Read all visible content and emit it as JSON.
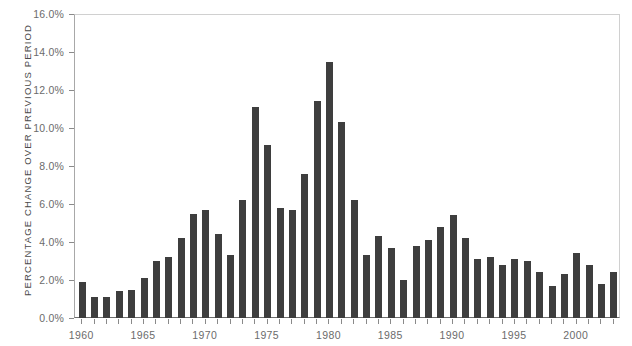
{
  "chart_data": {
    "type": "bar",
    "title": "",
    "subtitle": "",
    "xlabel": "",
    "ylabel": "PERCENTAGE CHANGE OVER PREVIOUS PERIOD",
    "ylim": [
      0,
      16
    ],
    "ytick_labels": [
      "0.0%",
      "2.0%",
      "4.0%",
      "6.0%",
      "8.0%",
      "10.0%",
      "12.0%",
      "14.0%",
      "16.0%"
    ],
    "ytick_values": [
      0,
      2,
      4,
      6,
      8,
      10,
      12,
      14,
      16
    ],
    "xtick_labels": [
      "1960",
      "1965",
      "1970",
      "1975",
      "1980",
      "1985",
      "1990",
      "1995",
      "2000"
    ],
    "xtick_values": [
      1960,
      1965,
      1970,
      1975,
      1980,
      1985,
      1990,
      1995,
      2000
    ],
    "grid": false,
    "legend": null,
    "bar_color": "#3e3e3e",
    "axis_color": "#8a8a8a",
    "text_color": "#6b6b6b",
    "categories": [
      "1960",
      "1961",
      "1962",
      "1963",
      "1964",
      "1965",
      "1966",
      "1967",
      "1968",
      "1969",
      "1970",
      "1971",
      "1972",
      "1973",
      "1974",
      "1975",
      "1976",
      "1977",
      "1978",
      "1979",
      "1980",
      "1981",
      "1982",
      "1983",
      "1984",
      "1985",
      "1986",
      "1987",
      "1988",
      "1989",
      "1990",
      "1991",
      "1992",
      "1993",
      "1994",
      "1995",
      "1996",
      "1997",
      "1998",
      "1999",
      "2000",
      "2001",
      "2002",
      "2003"
    ],
    "values": [
      1.9,
      1.1,
      1.1,
      1.4,
      1.5,
      2.1,
      3.0,
      3.2,
      4.2,
      5.5,
      5.7,
      4.4,
      3.3,
      6.2,
      11.1,
      9.1,
      5.8,
      5.7,
      7.6,
      11.4,
      13.5,
      10.3,
      6.2,
      3.3,
      4.3,
      3.7,
      2.0,
      3.8,
      4.1,
      4.8,
      5.4,
      4.2,
      3.1,
      3.2,
      2.8,
      3.1,
      3.0,
      2.4,
      1.7,
      2.3,
      3.4,
      2.8,
      1.8,
      2.4
    ],
    "series": [
      {
        "name": "Percentage change over previous period",
        "values": [
          1.9,
          1.1,
          1.1,
          1.4,
          1.5,
          2.1,
          3.0,
          3.2,
          4.2,
          5.5,
          5.7,
          4.4,
          3.3,
          6.2,
          11.1,
          9.1,
          5.8,
          5.7,
          7.6,
          11.4,
          13.5,
          10.3,
          6.2,
          3.3,
          4.3,
          3.7,
          2.0,
          3.8,
          4.1,
          4.8,
          5.4,
          4.2,
          3.1,
          3.2,
          2.8,
          3.1,
          3.0,
          2.4,
          1.7,
          2.3,
          3.4,
          2.8,
          1.8,
          2.4
        ]
      }
    ]
  }
}
